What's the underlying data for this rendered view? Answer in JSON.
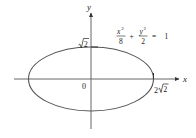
{
  "diagram": {
    "type": "ellipse-graph",
    "equation": {
      "term1_numerator": "x",
      "term1_exponent": "2",
      "term1_denominator": "8",
      "plus": "+",
      "term2_numerator": "y",
      "term2_exponent": "2",
      "term2_denominator": "2",
      "equals": "=",
      "rhs": "1"
    },
    "axes": {
      "x_label": "x",
      "y_label": "y",
      "origin_label": "0"
    },
    "intercepts": {
      "y_intercept_label": "√2",
      "y_intercept_radicand": "2",
      "x_intercept_label": "2√2",
      "x_intercept_coefficient": "2",
      "x_intercept_radicand": "2"
    },
    "ellipse": {
      "semi_major_a_squared": 8,
      "semi_minor_b_squared": 2,
      "center": [
        0,
        0
      ]
    },
    "colors": {
      "curve": "#555555",
      "axes": "#555555",
      "text": "#222222"
    }
  }
}
